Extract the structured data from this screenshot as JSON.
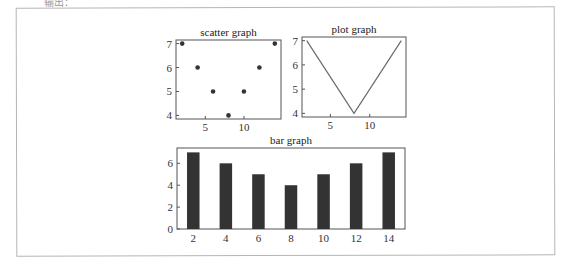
{
  "caption": "输出：",
  "chart_data": [
    {
      "type": "scatter",
      "title": "scatter graph",
      "x": [
        2,
        4,
        6,
        8,
        10,
        12,
        14
      ],
      "y": [
        7,
        6,
        5,
        4,
        5,
        6,
        7
      ],
      "xlabel": "",
      "ylabel": "",
      "xticks": [
        5,
        10
      ],
      "yticks": [
        4,
        5,
        6,
        7
      ],
      "xlim": [
        1.2,
        14.8
      ],
      "ylim": [
        3.85,
        7.15
      ],
      "grid": false
    },
    {
      "type": "line",
      "title": "plot graph",
      "x": [
        2,
        4,
        6,
        8,
        10,
        12,
        14
      ],
      "y": [
        7,
        6,
        5,
        4,
        5,
        6,
        7
      ],
      "xlabel": "",
      "ylabel": "",
      "xticks": [
        5,
        10
      ],
      "yticks": [
        4,
        5,
        6,
        7
      ],
      "xlim": [
        1.4,
        14.6
      ],
      "ylim": [
        3.85,
        7.15
      ],
      "grid": false
    },
    {
      "type": "bar",
      "title": "bar graph",
      "categories": [
        "2",
        "4",
        "6",
        "8",
        "10",
        "12",
        "14"
      ],
      "values": [
        7,
        6,
        5,
        4,
        5,
        6,
        7
      ],
      "xlabel": "",
      "ylabel": "",
      "yticks": [
        0,
        2,
        4,
        6
      ],
      "ylim": [
        0,
        7.4
      ],
      "grid": false
    }
  ],
  "colors": {
    "axis": "#555555",
    "marker": "#333333",
    "line": "#6b6b6b",
    "bar": "#333333",
    "frame": "#b5b5b5"
  }
}
